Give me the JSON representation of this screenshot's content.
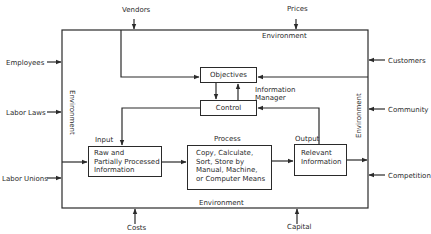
{
  "diagram": {
    "external_inputs": {
      "top": [
        "Vendors",
        "Prices"
      ],
      "left": [
        "Employees",
        "Labor Laws",
        "Labor Unions"
      ],
      "right": [
        "Customers",
        "Community",
        "Competition"
      ],
      "bottom": [
        "Costs",
        "Capital"
      ]
    },
    "environment_labels": {
      "top": "Environment",
      "bottom": "Environment",
      "left": "Environment",
      "right": "Environment"
    },
    "nodes": {
      "objectives": "Objectives",
      "control": "Control",
      "information_manager": [
        "Information",
        "Manager"
      ],
      "input": {
        "caption": "Input",
        "lines": [
          "Raw and",
          "Partially Processed",
          "Information"
        ]
      },
      "process": {
        "caption": "Process",
        "lines": [
          "Copy, Calculate,",
          "Sort, Store by",
          "Manual, Machine,",
          "or Computer Means"
        ]
      },
      "output": {
        "caption": "Output",
        "lines": [
          "Relevant",
          "Information"
        ]
      }
    },
    "colors": {
      "line": "#2a2a2a",
      "background": "#ffffff"
    }
  }
}
